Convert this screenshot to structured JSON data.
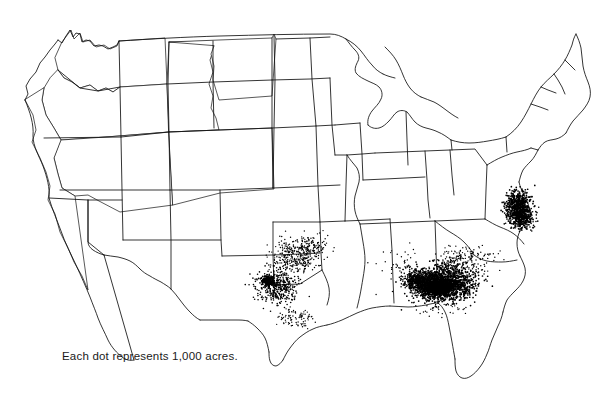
{
  "map": {
    "title": "United States dot density map",
    "caption": "Each dot represents 1,000 acres.",
    "background_color": "#ffffff",
    "outline_color": "#111111",
    "dot_color": "#000000",
    "projection_note": "Conterminous United States with state boundaries",
    "dot_unit_value": 1000,
    "dot_unit_label": "acres"
  },
  "chart_data": {
    "type": "scatter",
    "title": "",
    "xlabel": "",
    "ylabel": "",
    "legend": "Each dot represents 1,000 acres.",
    "dot_value": 1000,
    "dot_units": "acres",
    "xlim": [
      0,
      612
    ],
    "ylim": [
      0,
      393
    ],
    "grid": false,
    "legend_position": "bottom-left",
    "clusters": [
      {
        "name": "South Georgia - Southeast Alabama",
        "cx": 444,
        "cy": 284,
        "rx": 30,
        "ry": 17,
        "count": 1500,
        "density": "very-high"
      },
      {
        "name": "Southwest Georgia core",
        "cx": 438,
        "cy": 288,
        "rx": 16,
        "ry": 9,
        "count": 900,
        "density": "solid"
      },
      {
        "name": "Southeast Alabama Wiregrass",
        "cx": 419,
        "cy": 281,
        "rx": 14,
        "ry": 10,
        "count": 520,
        "density": "high"
      },
      {
        "name": "Central Georgia scatter",
        "cx": 455,
        "cy": 264,
        "rx": 20,
        "ry": 13,
        "count": 200,
        "density": "medium"
      },
      {
        "name": "Southeast Virginia - Northeast North Carolina",
        "cx": 518,
        "cy": 207,
        "rx": 13,
        "ry": 16,
        "count": 620,
        "density": "very-high"
      },
      {
        "name": "North Carolina coastal plain",
        "cx": 522,
        "cy": 219,
        "rx": 10,
        "ry": 9,
        "count": 300,
        "density": "high"
      },
      {
        "name": "West central Texas",
        "cx": 277,
        "cy": 286,
        "rx": 20,
        "ry": 16,
        "count": 420,
        "density": "high"
      },
      {
        "name": "Texas Gaines County core",
        "cx": 268,
        "cy": 281,
        "rx": 7,
        "ry": 6,
        "count": 190,
        "density": "solid"
      },
      {
        "name": "Southwest Oklahoma",
        "cx": 302,
        "cy": 249,
        "rx": 22,
        "ry": 11,
        "count": 260,
        "density": "medium"
      },
      {
        "name": "Texas panhandle / Red River",
        "cx": 297,
        "cy": 262,
        "rx": 18,
        "ry": 8,
        "count": 150,
        "density": "medium"
      },
      {
        "name": "South Texas coastal bend",
        "cx": 295,
        "cy": 318,
        "rx": 12,
        "ry": 7,
        "count": 90,
        "density": "low"
      },
      {
        "name": "South Carolina scatter",
        "cx": 477,
        "cy": 258,
        "rx": 18,
        "ry": 12,
        "count": 70,
        "density": "low"
      },
      {
        "name": "Florida panhandle",
        "cx": 440,
        "cy": 305,
        "rx": 18,
        "ry": 8,
        "count": 60,
        "density": "low"
      },
      {
        "name": "Alabama - Mississippi scatter",
        "cx": 400,
        "cy": 268,
        "rx": 22,
        "ry": 18,
        "count": 55,
        "density": "very-low"
      }
    ],
    "empty_regions": [
      "Pacific Northwest",
      "Great Basin",
      "Northern Plains",
      "Upper Midwest",
      "New England",
      "Florida Peninsula"
    ]
  }
}
